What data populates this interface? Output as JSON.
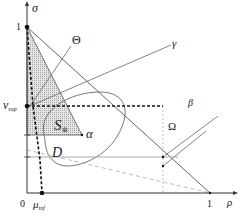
{
  "diagram": {
    "axes": {
      "y_label": "σ",
      "x_label": "ρ",
      "origin_label": "0",
      "y_unit_label": "1",
      "x_unit_label": "1"
    },
    "points": {
      "nu_sup": {
        "symbol": "ν",
        "subscript": "sup"
      },
      "mu_inf": {
        "symbol": "μ",
        "subscript": "inf"
      },
      "alpha": "α"
    },
    "regions": {
      "S": {
        "symbol": "S",
        "subscript": "⊚"
      },
      "D": "D"
    },
    "lines": {
      "theta": "Θ",
      "gamma": "γ",
      "beta": "β",
      "omega": "Ω"
    },
    "colors": {
      "axis": "#333333",
      "line": "#555555",
      "light_line": "#999999",
      "shading": "#d8d8d8",
      "dash": "#111111"
    }
  }
}
